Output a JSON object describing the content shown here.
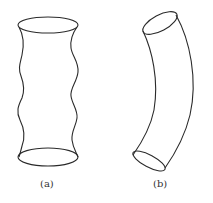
{
  "figure": {
    "panels": [
      {
        "id": "a",
        "label": "(a)",
        "description": "Vertical tube with wavy (buckled) sides"
      },
      {
        "id": "b",
        "label": "(b)",
        "description": "Curved (bent) tube"
      }
    ],
    "colors": {
      "line": "#2a2a2a",
      "background": "#ffffff",
      "label": "#333333"
    }
  }
}
